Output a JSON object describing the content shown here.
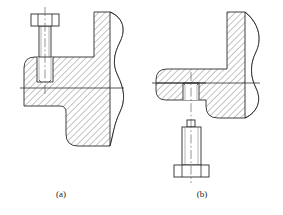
{
  "drawing": {
    "title": "Bolted joint cross-section views",
    "type": "engineering-section-drawing",
    "stroke_color": "#2b2b2b",
    "hatch_color": "#4a4a4a",
    "centerline_color": "#3a3a3a",
    "background_color": "#ffffff",
    "line_width": 0.8,
    "hatch_spacing": 4,
    "hatch_angle_deg": 45
  },
  "figures": [
    {
      "id": "a",
      "caption": "(a)",
      "description": "L-shaped bracket section with hex-head bolt inserted from above into a blind tapped hole",
      "bolt_direction": "from-top",
      "parts": [
        {
          "name": "bracket-body",
          "hatched": true
        },
        {
          "name": "bolt-head",
          "hatched": false
        },
        {
          "name": "bolt-shank",
          "hatched": false
        },
        {
          "name": "tapped-hole",
          "hatched": false
        },
        {
          "name": "break-line",
          "hatched": false
        },
        {
          "name": "axis-centerline",
          "hatched": false
        },
        {
          "name": "horizontal-centerline",
          "hatched": false
        }
      ]
    },
    {
      "id": "b",
      "caption": "(b)",
      "description": "Inverted L-shaped bracket section with hex-head bolt inserted from below into a through hole",
      "bolt_direction": "from-bottom",
      "parts": [
        {
          "name": "bracket-body",
          "hatched": true
        },
        {
          "name": "bolt-head",
          "hatched": false
        },
        {
          "name": "bolt-shank",
          "hatched": false
        },
        {
          "name": "through-hole",
          "hatched": false
        },
        {
          "name": "break-line",
          "hatched": false
        },
        {
          "name": "axis-centerline",
          "hatched": false
        },
        {
          "name": "horizontal-centerline",
          "hatched": false
        }
      ]
    }
  ],
  "captions": {
    "a": "(a)",
    "b": "(b)"
  }
}
